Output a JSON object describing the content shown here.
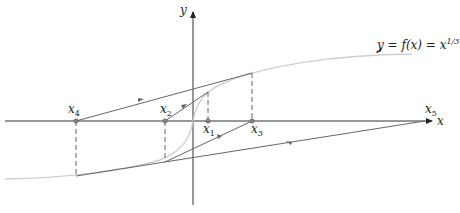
{
  "figure": {
    "type": "newton-method-divergence",
    "curve_label": "y = f(x) = x",
    "curve_exponent": "1/3",
    "axes": {
      "x_label": "x",
      "y_label": "y"
    },
    "points": [
      {
        "name": "x",
        "sub": "1"
      },
      {
        "name": "x",
        "sub": "2"
      },
      {
        "name": "x",
        "sub": "3"
      },
      {
        "name": "x",
        "sub": "4"
      },
      {
        "name": "x",
        "sub": "5"
      }
    ],
    "colors": {
      "curve": "#c8c8c8",
      "lines": "#555555",
      "axes": "#333333",
      "points": "#777777"
    }
  }
}
